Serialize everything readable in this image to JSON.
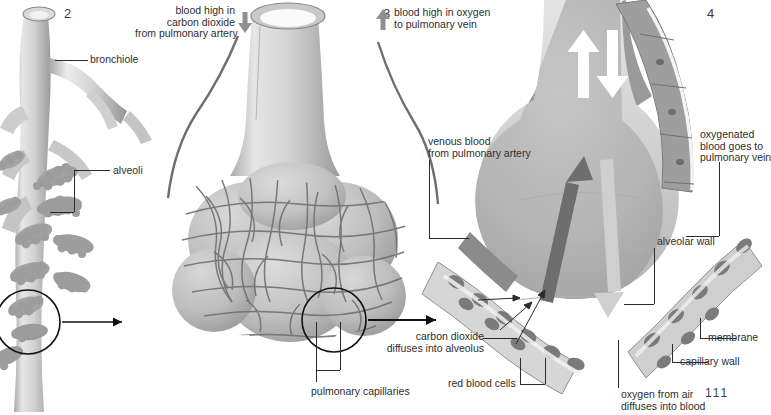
{
  "figure": {
    "title_page_number": "111",
    "background": "#ffffff",
    "ink": "#2b2b2b",
    "palette": {
      "bronchiole_light": "#e3e3e3",
      "bronchiole_mid": "#c2c2c2",
      "bronchiole_dark": "#8f8f8f",
      "alveoli_cluster": "#9a9a9a",
      "sac_body": "#c9c9c9",
      "sac_shadow": "#a2a2a2",
      "capillary_line": "#6f6f6f",
      "alveolus_interior": "#b6b6b6",
      "capillary_wall": "#d3d3d3",
      "cell_nucleus": "#7b7b7b",
      "arrow_dark": "#6e6e6e",
      "arrow_light": "#cfcfcf",
      "arrow_white": "#ffffff"
    }
  },
  "panels": [
    {
      "number": "2",
      "name": "bronchiole-with-alveoli"
    },
    {
      "number": "3",
      "name": "alveolar-sac-with-capillaries"
    },
    {
      "number": "4",
      "name": "alveolus-cross-section"
    }
  ],
  "labels": {
    "panel2_number": "2",
    "panel3_number": "3",
    "panel4_number": "4",
    "bronchiole": "bronchiole",
    "alveoli": "alveoli",
    "blood_high_co2": "blood high in\ncarbon dioxide\nfrom pulmonary artery",
    "blood_high_o2": "blood high in oxygen\nto pulmonary vein",
    "venous_blood": "venous blood\nfrom pulmonary artery",
    "oxygenated_blood": "oxygenated\nblood goes to\npulmonary vein",
    "alveolar_wall": "alveolar wall",
    "membrane": "membrane",
    "capillary_wall": "capillary wall",
    "pulmonary_capillaries": "pulmonary capillaries",
    "carbon_dioxide_diffuses": "carbon dioxide\ndiffuses into alveolus",
    "red_blood_cells": "red blood cells",
    "oxygen_diffuses": "oxygen from air\ndiffuses into blood",
    "page_number": "111"
  },
  "arrows": {
    "co2_in_direction": "down",
    "o2_out_direction": "up",
    "magnify_direction": "right",
    "interior_air_in": "down",
    "interior_air_out": "up"
  }
}
